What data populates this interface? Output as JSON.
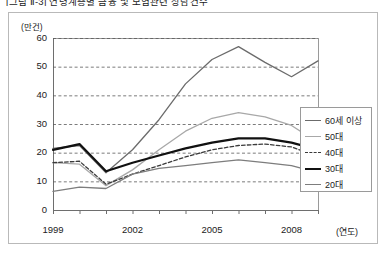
{
  "caption": "[그림 Ⅱ-3] 연령계층별 금융 및 보험관련 상담건수",
  "figure": {
    "y_unit": "(만건)",
    "x_unit": "(연도)"
  },
  "chart_data": {
    "type": "line",
    "title": "",
    "xlabel": "(연도)",
    "ylabel": "(만건)",
    "ylim": [
      0,
      60
    ],
    "ytick_labels": [
      "0",
      "10",
      "20",
      "30",
      "40",
      "50",
      "60"
    ],
    "yticks": [
      0,
      10,
      20,
      30,
      40,
      50,
      60
    ],
    "x": [
      1999,
      2000,
      2001,
      2002,
      2003,
      2004,
      2005,
      2006,
      2007,
      2008,
      2009
    ],
    "xtick_labels": [
      "1999",
      "2002",
      "2005",
      "2008"
    ],
    "xticks_labeled": [
      1999,
      2002,
      2005,
      2008
    ],
    "grid": "horizontal-dashed",
    "legend_position": "right-middle",
    "series": [
      {
        "name": "60세 이상",
        "color": "#6b6b6b",
        "style": "solid",
        "width": 1.3,
        "values": [
          21.5,
          22.5,
          13.0,
          21.0,
          31.5,
          44.0,
          52.5,
          57.0,
          51.5,
          46.5,
          52.0
        ]
      },
      {
        "name": "50대",
        "color": "#a8a8a8",
        "style": "solid",
        "width": 1.3,
        "values": [
          16.5,
          16.0,
          8.5,
          14.0,
          21.0,
          27.5,
          32.0,
          34.0,
          32.5,
          29.5,
          23.5
        ]
      },
      {
        "name": "40대",
        "color": "#3a3a3a",
        "style": "dashed",
        "width": 1.3,
        "values": [
          16.5,
          17.0,
          9.0,
          12.5,
          15.5,
          18.5,
          21.0,
          22.5,
          23.0,
          22.0,
          18.5
        ]
      },
      {
        "name": "30대",
        "color": "#111111",
        "style": "solid",
        "width": 2.2,
        "values": [
          21.0,
          23.0,
          13.5,
          16.5,
          19.0,
          21.5,
          23.5,
          25.0,
          25.0,
          23.5,
          21.0
        ]
      },
      {
        "name": "20대",
        "color": "#7d7d7d",
        "style": "solid",
        "width": 1.3,
        "values": [
          6.5,
          8.0,
          7.5,
          12.5,
          14.5,
          15.5,
          16.5,
          17.5,
          16.5,
          15.5,
          13.0
        ]
      }
    ]
  }
}
